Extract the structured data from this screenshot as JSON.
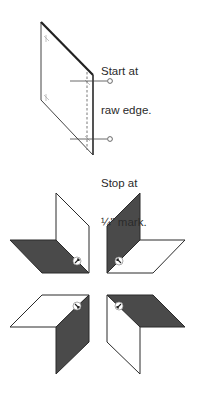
{
  "diagram": {
    "step1": {
      "label_start_line1": "Start at",
      "label_start_line2": "raw edge.",
      "label_stop_line1": "Stop at",
      "label_stop_line2": "¼\" mark."
    },
    "step2": {
      "pieces": [
        {
          "position": "top-left",
          "white": "upper vertical",
          "dark": "lower horizontal"
        },
        {
          "position": "top-right",
          "white": "lower horizontal",
          "dark": "upper vertical"
        },
        {
          "position": "bottom-left",
          "white": "upper horizontal",
          "dark": "lower vertical"
        },
        {
          "position": "bottom-right",
          "white": "lower vertical",
          "dark": "upper horizontal"
        }
      ]
    },
    "colors": {
      "stroke": "#333333",
      "dark_fill": "#4a4a4a",
      "paper": "#ffffff"
    }
  }
}
